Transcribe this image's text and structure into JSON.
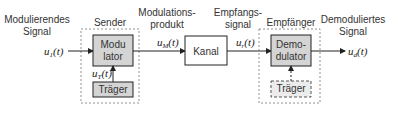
{
  "diagram": {
    "type": "block-diagram",
    "labels": {
      "input_signal_line1": "Modulierendes",
      "input_signal_line2": "Signal",
      "sender": "Sender",
      "mod_product_line1": "Modulations-",
      "mod_product_line2": "produkt",
      "receive_signal_line1": "Empfangs-",
      "receive_signal_line2": "signal",
      "receiver": "Empfänger",
      "output_signal_line1": "Demoduliertes",
      "output_signal_line2": "Signal"
    },
    "blocks": {
      "modulator_line1": "Modu",
      "modulator_line2": "lator",
      "carrier_sender": "Träger",
      "channel": "Kanal",
      "demodulator_line1": "Demo-",
      "demodulator_line2": "dulator",
      "carrier_receiver": "Träger"
    },
    "signals": {
      "u1": {
        "base": "u",
        "sub": "1",
        "arg": "(t)"
      },
      "uT": {
        "base": "u",
        "sub": "T",
        "arg": "(t)"
      },
      "uM": {
        "base": "u",
        "sub": "M",
        "arg": "(t)"
      },
      "ue": {
        "base": "u",
        "sub": "r",
        "arg": "(t)"
      },
      "ud": {
        "base": "u",
        "sub": "d",
        "arg": "(t)"
      }
    },
    "colors": {
      "block_fill": "#d4d4d4",
      "carrier_fill": "#e6e6e6",
      "stroke": "#222222",
      "dashed": "#777777"
    }
  }
}
